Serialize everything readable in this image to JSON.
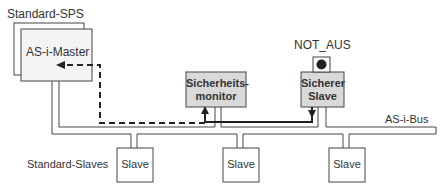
{
  "labels": {
    "standard_sps": "Standard-SPS",
    "as_i_master": "AS-i-Master",
    "not_aus": "NOT_AUS",
    "safety_monitor_line1": "Sicherheits-",
    "safety_monitor_line2": "monitor",
    "safe_slave_line1": "Sicherer",
    "safe_slave_line2": "Slave",
    "as_i_bus": "AS-i-Bus",
    "standard_slaves": "Standard-Slaves"
  },
  "slaves": [
    {
      "label": "Slave"
    },
    {
      "label": "Slave"
    },
    {
      "label": "Slave"
    }
  ],
  "colors": {
    "box_fill": "#f2f2f2",
    "gray_box_fill": "#d9d9d9",
    "line": "#333333"
  }
}
